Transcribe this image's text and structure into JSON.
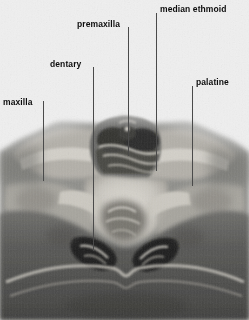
{
  "figure": {
    "kind": "anatomical-cross-section-micrograph",
    "width": 249,
    "height": 320,
    "background_color": "#efefef",
    "label_color": "#0d0d0d",
    "leader_color": "#4a4a4a"
  },
  "labels": [
    {
      "id": "maxilla",
      "text": "maxilla",
      "text_x": 3,
      "text_y": 97,
      "leader_x": 43,
      "leader_top": 101,
      "leader_bottom": 181
    },
    {
      "id": "dentary",
      "text": "dentary",
      "text_x": 50,
      "text_y": 59,
      "leader_x": 93,
      "leader_top": 67,
      "leader_bottom": 251
    },
    {
      "id": "premaxilla",
      "text": "premaxilla",
      "text_x": 77,
      "text_y": 19,
      "leader_x": 128,
      "leader_top": 27,
      "leader_bottom": 156
    },
    {
      "id": "median-ethmoid",
      "text": "median ethmoid",
      "text_x": 160,
      "text_y": 4,
      "leader_x": 156,
      "leader_top": 13,
      "leader_bottom": 171
    },
    {
      "id": "palatine",
      "text": "palatine",
      "text_x": 196,
      "text_y": 77,
      "leader_x": 192,
      "leader_top": 86,
      "leader_bottom": 186
    }
  ],
  "tissue_tones": {
    "background_light": "#efefef",
    "pale_bone": "#d8d5cf",
    "mid_tissue": "#9a9a96",
    "dark_tissue": "#5d5d5b",
    "cavity_dark": "#2b2b2a",
    "lower_mass": "#565654"
  }
}
